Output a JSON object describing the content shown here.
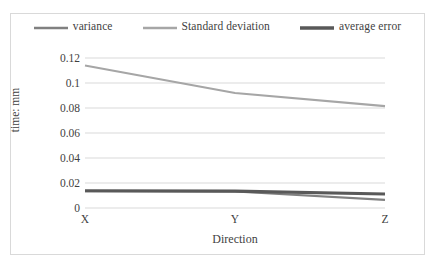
{
  "chart_data": {
    "type": "line",
    "title": "",
    "xlabel": "Direction",
    "ylabel": "time: mm",
    "categories": [
      "X",
      "Y",
      "Z"
    ],
    "ylim": [
      0,
      0.12
    ],
    "y_ticks": [
      "0",
      "0.02",
      "0.04",
      "0.06",
      "0.08",
      "0.1",
      "0.12"
    ],
    "y_tick_values": [
      0,
      0.02,
      0.04,
      0.06,
      0.08,
      0.1,
      0.12
    ],
    "grid": true,
    "legend_position": "top",
    "series": [
      {
        "name": "variance",
        "values": [
          0.0135,
          0.0132,
          0.0065
        ],
        "color": "#808080",
        "width": 2.2
      },
      {
        "name": "Standard deviation",
        "values": [
          0.114,
          0.092,
          0.0815
        ],
        "color": "#a6a6a6",
        "width": 2.2
      },
      {
        "name": "average error",
        "values": [
          0.0138,
          0.0135,
          0.0112
        ],
        "color": "#595959",
        "width": 3.2
      }
    ]
  },
  "legend": {
    "items": [
      {
        "label": "variance",
        "color": "#808080",
        "thickness": "2.5px"
      },
      {
        "label": "Standard deviation",
        "color": "#a6a6a6",
        "thickness": "2.5px"
      },
      {
        "label": "average error",
        "color": "#595959",
        "thickness": "3.5px"
      }
    ]
  },
  "axes": {
    "y_title": "time: mm",
    "x_title": "Direction",
    "y_ticks": [
      "0.12",
      "0.1",
      "0.08",
      "0.06",
      "0.04",
      "0.02",
      "0"
    ],
    "x_ticks": [
      "X",
      "Y",
      "Z"
    ]
  },
  "colors": {
    "grid": "#d9d9d9",
    "frame": "#d9d9d9",
    "text": "#3f3f3f",
    "background": "#ffffff"
  }
}
